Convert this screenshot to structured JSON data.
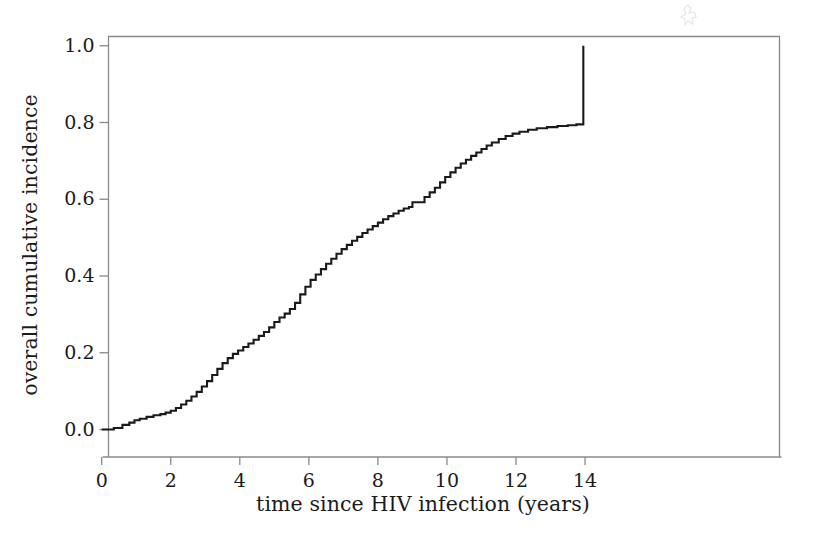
{
  "figure": {
    "background_color": "#ffffff",
    "frame_color": "#8a8a8a",
    "curve_color": "#1a1a1a",
    "text_color": "#1b1b1b",
    "artifact_name": "scan-artifact-mark"
  },
  "chart_data": {
    "type": "line",
    "title": "",
    "subtitle": "",
    "xlabel": "time since HIV infection (years)",
    "ylabel": "overall cumulative incidence",
    "xlim": [
      -0.35,
      14.75
    ],
    "ylim": [
      -0.045,
      1.045
    ],
    "xticks": [
      0,
      2,
      4,
      6,
      8,
      10,
      12,
      14
    ],
    "xticklabels": [
      "0",
      "2",
      "4",
      "6",
      "8",
      "10",
      "12",
      "14"
    ],
    "yticks": [
      0.0,
      0.2,
      0.4,
      0.6,
      0.8,
      1.0
    ],
    "yticklabels": [
      "0.0",
      "0.2",
      "0.4",
      "0.6",
      "0.8",
      "1.0"
    ],
    "grid": false,
    "legend": null,
    "legend_position": "none",
    "step_style": "post",
    "series": [
      {
        "name": "overall cumulative incidence",
        "color": "#1a1a1a",
        "x": [
          0.0,
          0.35,
          0.6,
          0.8,
          0.95,
          1.1,
          1.3,
          1.5,
          1.7,
          1.85,
          2.0,
          2.15,
          2.3,
          2.45,
          2.6,
          2.75,
          2.9,
          3.05,
          3.2,
          3.35,
          3.5,
          3.65,
          3.8,
          3.95,
          4.1,
          4.25,
          4.4,
          4.55,
          4.7,
          4.85,
          5.0,
          5.15,
          5.3,
          5.45,
          5.6,
          5.75,
          5.9,
          6.05,
          6.2,
          6.35,
          6.5,
          6.65,
          6.8,
          6.95,
          7.1,
          7.25,
          7.4,
          7.55,
          7.7,
          7.85,
          8.0,
          8.15,
          8.3,
          8.45,
          8.6,
          8.75,
          8.9,
          9.0,
          9.35,
          9.5,
          9.65,
          9.8,
          9.95,
          10.1,
          10.25,
          10.4,
          10.55,
          10.7,
          10.85,
          11.0,
          11.15,
          11.3,
          11.5,
          11.7,
          11.9,
          12.1,
          12.35,
          12.6,
          12.9,
          13.2,
          13.5,
          13.75,
          13.9,
          13.95
        ],
        "y": [
          0.0,
          0.004,
          0.012,
          0.018,
          0.024,
          0.028,
          0.033,
          0.037,
          0.04,
          0.044,
          0.049,
          0.056,
          0.065,
          0.075,
          0.086,
          0.098,
          0.112,
          0.126,
          0.142,
          0.158,
          0.173,
          0.186,
          0.197,
          0.206,
          0.215,
          0.224,
          0.234,
          0.244,
          0.254,
          0.266,
          0.28,
          0.292,
          0.302,
          0.314,
          0.33,
          0.352,
          0.372,
          0.39,
          0.404,
          0.418,
          0.432,
          0.445,
          0.458,
          0.47,
          0.481,
          0.492,
          0.502,
          0.512,
          0.521,
          0.53,
          0.539,
          0.548,
          0.556,
          0.563,
          0.57,
          0.576,
          0.58,
          0.592,
          0.606,
          0.618,
          0.63,
          0.644,
          0.658,
          0.67,
          0.682,
          0.693,
          0.703,
          0.713,
          0.722,
          0.731,
          0.74,
          0.748,
          0.757,
          0.765,
          0.771,
          0.776,
          0.781,
          0.785,
          0.788,
          0.791,
          0.793,
          0.795,
          0.795,
          1.0
        ],
        "annotations": [
          {
            "label": "flat start near zero",
            "x_range": [
              0.0,
              0.8
            ],
            "y": 0.0
          },
          {
            "label": "plateau before terminal jump",
            "x_range": [
              13.5,
              13.95
            ],
            "y": 0.795
          },
          {
            "label": "terminal vertical jump to 1.0",
            "x": 13.95,
            "y_from": 0.795,
            "y_to": 1.0
          }
        ]
      }
    ]
  }
}
